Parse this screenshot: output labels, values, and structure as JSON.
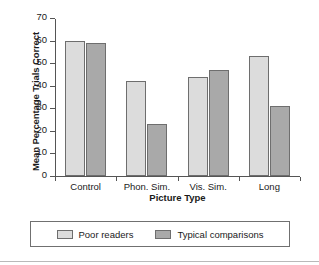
{
  "chart_data": {
    "type": "bar",
    "title": "",
    "xlabel": "Picture Type",
    "ylabel": "Mean Percentage Trials Correct",
    "categories": [
      "Control",
      "Phon. Sim.",
      "Vis. Sim.",
      "Long"
    ],
    "series": [
      {
        "name": "Poor readers",
        "values": [
          60,
          42,
          44,
          53
        ],
        "color": "#dcdcdc"
      },
      {
        "name": "Typical comparisons",
        "values": [
          59,
          23,
          47,
          31
        ],
        "color": "#a9a9a9"
      }
    ],
    "ylim": [
      0,
      70
    ],
    "ytick_labels": [
      "0",
      "10",
      "20",
      "30",
      "40",
      "50",
      "60",
      "70"
    ],
    "ytick_values": [
      0,
      10,
      20,
      30,
      40,
      50,
      60,
      70
    ],
    "grid": false,
    "legend_position": "bottom"
  }
}
